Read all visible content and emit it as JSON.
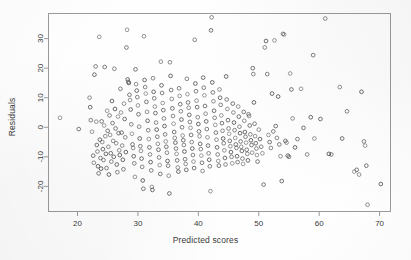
{
  "figure": {
    "name": "residuals-vs-predicted-scatter",
    "background_color": "#fefefe",
    "frame_color": "#9a9a9a",
    "point_color": "#4a4a4a",
    "text_color": "#3b3b3b"
  },
  "chart_data": {
    "type": "scatter",
    "title": "",
    "xlabel": "Predicted scores",
    "ylabel": "Residuals",
    "xlim": [
      15.2,
      71.8
    ],
    "ylim": [
      -28.5,
      38.5
    ],
    "grid": false,
    "legend": null,
    "marker": "open-circle",
    "xticks": [
      20,
      30,
      40,
      50,
      60,
      70
    ],
    "xticklabels": [
      "20",
      "30",
      "40",
      "50",
      "60",
      "70"
    ],
    "yticks": [
      30,
      20,
      10,
      0,
      -10,
      -20
    ],
    "yticklabels": [
      "30",
      "20",
      "10",
      "0",
      "-10",
      "-20"
    ],
    "n_points": 404,
    "points": [
      [
        17.1,
        3.2
      ],
      [
        20.2,
        -0.6
      ],
      [
        22.0,
        10.0
      ],
      [
        22.1,
        6.8
      ],
      [
        22.2,
        2.4
      ],
      [
        22.4,
        -1.5
      ],
      [
        22.6,
        -9.6
      ],
      [
        22.7,
        -12.0
      ],
      [
        22.8,
        17.8
      ],
      [
        23.0,
        20.6
      ],
      [
        23.1,
        1.9
      ],
      [
        23.2,
        -6.0
      ],
      [
        23.3,
        -8.2
      ],
      [
        23.4,
        -13.2
      ],
      [
        23.5,
        -15.6
      ],
      [
        23.6,
        30.6
      ],
      [
        23.7,
        -4.2
      ],
      [
        23.8,
        -10.4
      ],
      [
        23.9,
        -14.0
      ],
      [
        24.0,
        2.0
      ],
      [
        24.1,
        -5.0
      ],
      [
        24.2,
        -7.4
      ],
      [
        24.3,
        -11.1
      ],
      [
        24.4,
        0.6
      ],
      [
        24.5,
        20.4
      ],
      [
        24.6,
        -3.0
      ],
      [
        24.7,
        -9.0
      ],
      [
        24.8,
        -13.8
      ],
      [
        24.9,
        5.6
      ],
      [
        25.0,
        -1.2
      ],
      [
        25.1,
        -6.6
      ],
      [
        25.2,
        -16.0
      ],
      [
        25.3,
        4.0
      ],
      [
        25.4,
        -2.6
      ],
      [
        25.5,
        -8.8
      ],
      [
        25.6,
        -11.6
      ],
      [
        25.7,
        8.9
      ],
      [
        25.8,
        1.4
      ],
      [
        25.9,
        -4.6
      ],
      [
        26.0,
        -10.0
      ],
      [
        26.1,
        19.8
      ],
      [
        26.2,
        6.2
      ],
      [
        26.3,
        -0.4
      ],
      [
        26.4,
        -5.4
      ],
      [
        26.5,
        -12.6
      ],
      [
        26.6,
        -15.2
      ],
      [
        26.7,
        3.6
      ],
      [
        26.8,
        -2.0
      ],
      [
        26.9,
        -7.8
      ],
      [
        27.0,
        -9.4
      ],
      [
        27.1,
        13.0
      ],
      [
        27.2,
        5.0
      ],
      [
        27.3,
        -1.8
      ],
      [
        27.4,
        -6.2
      ],
      [
        27.5,
        -11.0
      ],
      [
        27.6,
        -14.2
      ],
      [
        27.7,
        8.0
      ],
      [
        27.8,
        2.8
      ],
      [
        27.9,
        -3.4
      ],
      [
        28.0,
        -8.4
      ],
      [
        28.1,
        27.0
      ],
      [
        28.2,
        33.0
      ],
      [
        28.3,
        16.2
      ],
      [
        28.4,
        15.4
      ],
      [
        28.5,
        15.0
      ],
      [
        28.6,
        11.0
      ],
      [
        28.7,
        9.2
      ],
      [
        28.8,
        6.0
      ],
      [
        28.9,
        1.0
      ],
      [
        29.0,
        -2.2
      ],
      [
        29.1,
        -5.8
      ],
      [
        29.2,
        -7.0
      ],
      [
        29.3,
        -9.8
      ],
      [
        29.4,
        -12.2
      ],
      [
        29.5,
        -16.8
      ],
      [
        29.6,
        19.6
      ],
      [
        29.7,
        14.6
      ],
      [
        29.8,
        12.4
      ],
      [
        29.9,
        10.2
      ],
      [
        30.0,
        7.4
      ],
      [
        30.1,
        4.4
      ],
      [
        30.2,
        0.2
      ],
      [
        30.3,
        -3.8
      ],
      [
        30.4,
        -6.4
      ],
      [
        30.5,
        -8.0
      ],
      [
        30.6,
        -10.6
      ],
      [
        30.7,
        -13.4
      ],
      [
        30.8,
        -18.0
      ],
      [
        30.9,
        -20.8
      ],
      [
        31.0,
        30.8
      ],
      [
        31.1,
        16.0
      ],
      [
        31.2,
        13.6
      ],
      [
        31.3,
        11.4
      ],
      [
        31.4,
        8.6
      ],
      [
        31.5,
        5.2
      ],
      [
        31.6,
        2.2
      ],
      [
        31.7,
        -1.0
      ],
      [
        31.8,
        -4.0
      ],
      [
        31.9,
        -6.8
      ],
      [
        32.0,
        -9.2
      ],
      [
        32.1,
        -11.8
      ],
      [
        32.2,
        -14.6
      ],
      [
        32.3,
        -20.2
      ],
      [
        32.4,
        -21.2
      ],
      [
        32.5,
        16.6
      ],
      [
        32.6,
        12.0
      ],
      [
        32.7,
        9.8
      ],
      [
        32.8,
        7.0
      ],
      [
        32.9,
        4.8
      ],
      [
        33.0,
        1.6
      ],
      [
        33.1,
        -0.8
      ],
      [
        33.2,
        -3.2
      ],
      [
        33.3,
        -5.6
      ],
      [
        33.4,
        -7.6
      ],
      [
        33.5,
        -10.2
      ],
      [
        33.6,
        -12.8
      ],
      [
        33.7,
        -15.8
      ],
      [
        33.8,
        22.2
      ],
      [
        33.9,
        14.2
      ],
      [
        34.0,
        11.6
      ],
      [
        34.1,
        8.2
      ],
      [
        34.2,
        5.8
      ],
      [
        34.3,
        3.0
      ],
      [
        34.4,
        0.4
      ],
      [
        34.5,
        -2.4
      ],
      [
        34.6,
        -4.8
      ],
      [
        34.7,
        -6.6
      ],
      [
        34.8,
        -8.6
      ],
      [
        34.9,
        -11.4
      ],
      [
        35.0,
        -13.0
      ],
      [
        35.1,
        -16.4
      ],
      [
        35.2,
        -22.4
      ],
      [
        35.3,
        22.0
      ],
      [
        35.4,
        17.4
      ],
      [
        35.5,
        12.6
      ],
      [
        35.6,
        9.6
      ],
      [
        35.7,
        6.4
      ],
      [
        35.8,
        3.8
      ],
      [
        35.9,
        1.2
      ],
      [
        36.0,
        -1.6
      ],
      [
        36.1,
        -3.6
      ],
      [
        36.2,
        -5.2
      ],
      [
        36.3,
        -7.2
      ],
      [
        36.4,
        -9.0
      ],
      [
        36.5,
        -11.2
      ],
      [
        36.6,
        -13.6
      ],
      [
        36.7,
        -15.0
      ],
      [
        36.8,
        13.2
      ],
      [
        36.9,
        10.6
      ],
      [
        37.0,
        7.8
      ],
      [
        37.1,
        5.4
      ],
      [
        37.2,
        2.6
      ],
      [
        37.3,
        0.0
      ],
      [
        37.4,
        -2.8
      ],
      [
        37.5,
        -4.4
      ],
      [
        37.6,
        -6.0
      ],
      [
        37.7,
        -8.2
      ],
      [
        37.8,
        -10.8
      ],
      [
        37.9,
        -12.4
      ],
      [
        38.0,
        -14.4
      ],
      [
        38.1,
        16.4
      ],
      [
        38.2,
        11.2
      ],
      [
        38.3,
        8.4
      ],
      [
        38.4,
        6.6
      ],
      [
        38.5,
        4.2
      ],
      [
        38.6,
        1.8
      ],
      [
        38.7,
        -0.2
      ],
      [
        38.8,
        -2.6
      ],
      [
        38.9,
        -5.0
      ],
      [
        39.0,
        -7.2
      ],
      [
        39.1,
        -9.4
      ],
      [
        39.2,
        -11.6
      ],
      [
        39.3,
        -13.8
      ],
      [
        39.4,
        29.6
      ],
      [
        39.5,
        14.8
      ],
      [
        39.6,
        12.2
      ],
      [
        39.7,
        9.0
      ],
      [
        39.8,
        6.8
      ],
      [
        39.9,
        3.4
      ],
      [
        40.0,
        1.1
      ],
      [
        40.1,
        -1.4
      ],
      [
        40.2,
        -3.0
      ],
      [
        40.3,
        -5.6
      ],
      [
        40.4,
        -7.4
      ],
      [
        40.5,
        -9.6
      ],
      [
        40.6,
        -12.0
      ],
      [
        40.7,
        -14.8
      ],
      [
        40.8,
        16.8
      ],
      [
        40.9,
        13.4
      ],
      [
        41.0,
        10.8
      ],
      [
        41.1,
        7.2
      ],
      [
        41.2,
        4.6
      ],
      [
        41.3,
        2.0
      ],
      [
        41.4,
        -0.6
      ],
      [
        41.5,
        -3.4
      ],
      [
        41.6,
        -6.2
      ],
      [
        41.7,
        -8.8
      ],
      [
        41.8,
        -11.0
      ],
      [
        41.9,
        -13.2
      ],
      [
        42.0,
        -21.6
      ],
      [
        42.1,
        32.8
      ],
      [
        42.2,
        37.2
      ],
      [
        42.3,
        15.2
      ],
      [
        42.4,
        11.8
      ],
      [
        42.5,
        8.8
      ],
      [
        42.6,
        5.6
      ],
      [
        42.7,
        3.2
      ],
      [
        42.8,
        0.8
      ],
      [
        42.9,
        -1.8
      ],
      [
        43.0,
        -4.2
      ],
      [
        43.1,
        -6.8
      ],
      [
        43.2,
        -9.2
      ],
      [
        43.3,
        -11.4
      ],
      [
        43.4,
        -13.0
      ],
      [
        43.5,
        12.8
      ],
      [
        43.6,
        10.0
      ],
      [
        43.7,
        7.6
      ],
      [
        43.8,
        4.0
      ],
      [
        43.9,
        1.4
      ],
      [
        44.0,
        -1.2
      ],
      [
        44.1,
        -3.8
      ],
      [
        44.2,
        -5.4
      ],
      [
        44.3,
        -7.8
      ],
      [
        44.4,
        -10.4
      ],
      [
        44.5,
        -12.6
      ],
      [
        44.6,
        17.2
      ],
      [
        44.7,
        9.4
      ],
      [
        44.8,
        6.2
      ],
      [
        44.9,
        2.4
      ],
      [
        45.0,
        -0.4
      ],
      [
        45.1,
        -2.2
      ],
      [
        45.2,
        -4.6
      ],
      [
        45.3,
        -6.4
      ],
      [
        45.4,
        -8.4
      ],
      [
        45.5,
        -10.0
      ],
      [
        45.6,
        -12.2
      ],
      [
        45.7,
        8.0
      ],
      [
        45.8,
        5.0
      ],
      [
        45.9,
        1.6
      ],
      [
        46.0,
        -1.0
      ],
      [
        46.1,
        -3.6
      ],
      [
        46.2,
        -5.8
      ],
      [
        46.3,
        -7.0
      ],
      [
        46.4,
        -9.8
      ],
      [
        46.5,
        -11.8
      ],
      [
        46.6,
        7.0
      ],
      [
        46.7,
        3.6
      ],
      [
        46.8,
        0.2
      ],
      [
        46.9,
        -2.0
      ],
      [
        47.0,
        -4.8
      ],
      [
        47.1,
        -6.6
      ],
      [
        47.2,
        -8.0
      ],
      [
        47.3,
        -10.6
      ],
      [
        47.4,
        -12.4
      ],
      [
        47.5,
        5.2
      ],
      [
        47.6,
        2.2
      ],
      [
        47.7,
        -1.6
      ],
      [
        47.8,
        -3.2
      ],
      [
        47.9,
        -5.2
      ],
      [
        48.0,
        -7.6
      ],
      [
        48.1,
        -9.0
      ],
      [
        48.2,
        -11.2
      ],
      [
        48.3,
        4.4
      ],
      [
        48.4,
        3.8
      ],
      [
        48.5,
        0.6
      ],
      [
        48.6,
        -2.4
      ],
      [
        48.7,
        -4.4
      ],
      [
        48.8,
        -6.0
      ],
      [
        48.9,
        -8.6
      ],
      [
        49.0,
        20.0
      ],
      [
        49.1,
        18.0
      ],
      [
        49.2,
        8.4
      ],
      [
        49.3,
        1.2
      ],
      [
        49.4,
        -3.0
      ],
      [
        49.5,
        -5.4
      ],
      [
        49.6,
        -7.2
      ],
      [
        49.7,
        -9.4
      ],
      [
        49.8,
        -11.6
      ],
      [
        50.0,
        -0.8
      ],
      [
        50.2,
        -4.0
      ],
      [
        50.4,
        -6.6
      ],
      [
        50.6,
        -8.8
      ],
      [
        50.8,
        -19.4
      ],
      [
        51.0,
        27.0
      ],
      [
        51.2,
        29.2
      ],
      [
        51.4,
        18.0
      ],
      [
        51.6,
        -2.6
      ],
      [
        51.8,
        -5.0
      ],
      [
        52.0,
        -7.0
      ],
      [
        52.2,
        11.4
      ],
      [
        52.4,
        -1.4
      ],
      [
        52.6,
        29.4
      ],
      [
        52.8,
        0.4
      ],
      [
        53.0,
        -3.6
      ],
      [
        53.2,
        10.4
      ],
      [
        53.4,
        -5.8
      ],
      [
        53.6,
        -9.8
      ],
      [
        53.8,
        -18.2
      ],
      [
        54.0,
        31.6
      ],
      [
        54.2,
        31.4
      ],
      [
        54.4,
        -4.6
      ],
      [
        54.6,
        -5.2
      ],
      [
        54.8,
        -9.6
      ],
      [
        55.0,
        -10.0
      ],
      [
        55.2,
        18.2
      ],
      [
        55.4,
        12.8
      ],
      [
        55.6,
        3.0
      ],
      [
        56.0,
        -6.8
      ],
      [
        56.4,
        -4.0
      ],
      [
        57.0,
        13.0
      ],
      [
        57.4,
        -0.2
      ],
      [
        58.0,
        -9.2
      ],
      [
        58.6,
        3.4
      ],
      [
        59.0,
        24.4
      ],
      [
        59.2,
        -3.8
      ],
      [
        60.2,
        2.8
      ],
      [
        61.0,
        36.8
      ],
      [
        61.6,
        -9.0
      ],
      [
        62.0,
        -9.2
      ],
      [
        63.4,
        13.6
      ],
      [
        63.8,
        -3.8
      ],
      [
        64.6,
        5.4
      ],
      [
        65.8,
        -15.0
      ],
      [
        66.2,
        -14.4
      ],
      [
        66.6,
        -16.0
      ],
      [
        67.0,
        12.0
      ],
      [
        67.4,
        -4.8
      ],
      [
        67.6,
        -6.2
      ],
      [
        67.8,
        -13.0
      ],
      [
        68.0,
        -26.2
      ],
      [
        70.2,
        -19.2
      ]
    ]
  }
}
